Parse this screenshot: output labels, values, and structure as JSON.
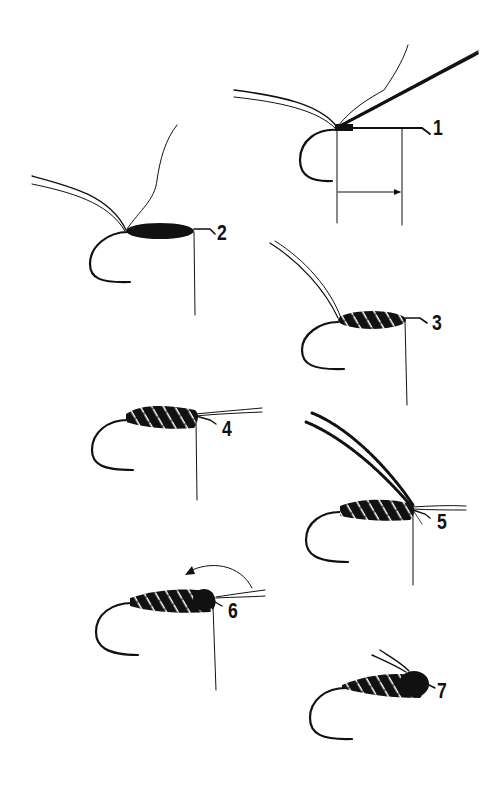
{
  "diagram": {
    "type": "fly-tying-steps",
    "ink_color": "#111111",
    "background": "#ffffff",
    "steps": [
      {
        "label": "1",
        "x": 433,
        "y": 117
      },
      {
        "label": "2",
        "x": 217,
        "y": 222
      },
      {
        "label": "3",
        "x": 432,
        "y": 312
      },
      {
        "label": "4",
        "x": 222,
        "y": 418
      },
      {
        "label": "5",
        "x": 437,
        "y": 511
      },
      {
        "label": "6",
        "x": 228,
        "y": 600
      },
      {
        "label": "7",
        "x": 437,
        "y": 680
      }
    ]
  }
}
